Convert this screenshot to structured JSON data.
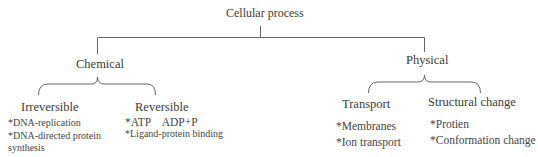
{
  "diagram": {
    "type": "tree",
    "root": {
      "label": "Cellular process"
    },
    "branches": [
      {
        "label": "Chemical",
        "children": [
          {
            "label": "Irreversible",
            "items": [
              "*DNA-replication",
              "*DNA-directed protein",
              "synthesis"
            ]
          },
          {
            "label": "Reversible",
            "items": [
              "*ATP    ADP+P",
              "*Ligand-protein binding"
            ]
          }
        ]
      },
      {
        "label": "Physical",
        "children": [
          {
            "label": "Transport",
            "items": [
              "*Membranes",
              "*Ion transport"
            ]
          },
          {
            "label": "Structural change",
            "items": [
              "*Protien",
              "*Conformation change"
            ]
          }
        ]
      }
    ],
    "colors": {
      "line": "#666666",
      "text": "#3a3a3a"
    }
  }
}
